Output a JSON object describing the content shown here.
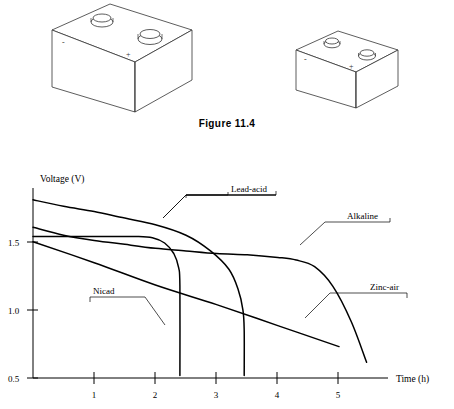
{
  "figure": {
    "caption": "Figure 11.4",
    "illustrations": [
      {
        "name": "large-battery",
        "negative_label": "-",
        "positive_label": "+"
      },
      {
        "name": "small-battery",
        "negative_label": "-",
        "positive_label": "+"
      }
    ]
  },
  "chart_data": {
    "type": "line",
    "title": "",
    "xlabel": "Time (h)",
    "ylabel": "Voltage (V)",
    "xlim": [
      0,
      5.8
    ],
    "ylim": [
      0.5,
      1.95
    ],
    "xticks": [
      "1",
      "2",
      "3",
      "4",
      "5"
    ],
    "xtick_values": [
      1,
      2,
      3,
      4,
      5
    ],
    "yticks": [
      "1.5",
      "1.0",
      "0.5"
    ],
    "ytick_values": [
      1.5,
      1.0,
      0.5
    ],
    "grid": false,
    "legend": "inline-labels",
    "series": [
      {
        "name": "Lead-acid",
        "x": [
          0.0,
          0.5,
          1.0,
          1.5,
          2.0,
          2.5,
          2.9,
          3.2,
          3.35,
          3.43,
          3.45,
          3.45
        ],
        "values": [
          1.86,
          1.81,
          1.77,
          1.72,
          1.67,
          1.59,
          1.47,
          1.33,
          1.18,
          1.02,
          0.86,
          0.52
        ]
      },
      {
        "name": "Nicad",
        "x": [
          0.0,
          0.6,
          1.2,
          1.7,
          1.95,
          2.15,
          2.3,
          2.38,
          2.4,
          2.4
        ],
        "values": [
          1.58,
          1.58,
          1.58,
          1.58,
          1.57,
          1.53,
          1.45,
          1.34,
          1.2,
          0.52
        ]
      },
      {
        "name": "Alkaline",
        "x": [
          0.0,
          0.5,
          1.0,
          1.5,
          2.0,
          2.5,
          3.0,
          3.5,
          4.0,
          4.3,
          4.6,
          4.9,
          5.2,
          5.45
        ],
        "values": [
          1.65,
          1.59,
          1.55,
          1.52,
          1.49,
          1.47,
          1.45,
          1.44,
          1.42,
          1.4,
          1.35,
          1.2,
          0.93,
          0.62
        ]
      },
      {
        "name": "Zinc-air",
        "x": [
          0.0,
          1.0,
          2.0,
          3.0,
          4.0,
          5.0
        ],
        "values": [
          1.54,
          1.38,
          1.21,
          1.06,
          0.9,
          0.74
        ]
      }
    ],
    "annotations": [
      {
        "text": "Lead-acid",
        "points_to_series": "Lead-acid"
      },
      {
        "text": "Nicad",
        "points_to_series": "Nicad"
      },
      {
        "text": "Alkaline",
        "points_to_series": "Alkaline"
      },
      {
        "text": "Zinc-air",
        "points_to_series": "Zinc-air"
      }
    ]
  }
}
